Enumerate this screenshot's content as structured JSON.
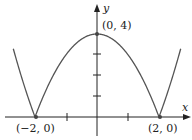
{
  "chart_data": {
    "type": "line",
    "title": "",
    "function": "y = |x^2 - 4|",
    "xlabel": "x",
    "ylabel": "y",
    "xlim": [
      -3.0,
      3.0
    ],
    "ylim": [
      -0.8,
      5.3
    ],
    "x_ticks": [
      -1,
      1
    ],
    "y_ticks": [
      1,
      2,
      3
    ],
    "grid": false,
    "series": [
      {
        "name": "y = |x^2 - 4|",
        "x": [
          -2.65,
          -2.5,
          -2.25,
          -2,
          -1.5,
          -1,
          -0.5,
          0,
          0.5,
          1,
          1.5,
          2,
          2.25,
          2.5,
          2.65
        ],
        "y": [
          3.02,
          2.25,
          1.06,
          0,
          1.75,
          3,
          3.75,
          4,
          3.75,
          3,
          1.75,
          0,
          1.06,
          2.25,
          3.02
        ]
      }
    ],
    "points": [
      {
        "x": 0,
        "y": 4,
        "label": "(0, 4)"
      },
      {
        "x": -2,
        "y": 0,
        "label": "(−2, 0)"
      },
      {
        "x": 2,
        "y": 0,
        "label": "(2, 0)"
      }
    ]
  },
  "labels": {
    "x_axis": "x",
    "y_axis": "y",
    "peak": "(0, 4)",
    "left_root": "(−2, 0)",
    "right_root": "(2, 0)"
  },
  "colors": {
    "curve": "#555555",
    "axis": "#222222",
    "point": "#444444"
  }
}
